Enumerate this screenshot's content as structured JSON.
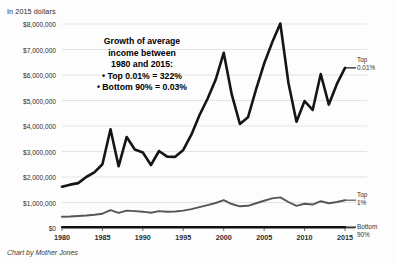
{
  "header": {
    "units_note": "In 2015 dollars"
  },
  "credit": {
    "text": "Chart by Mother Jones"
  },
  "annotation": {
    "line1": "Growth of average",
    "line2": "income between",
    "line3": "1980 and 2015:",
    "line4": "• Top 0.01% = 322%",
    "line5": "• Bottom 90% = 0.03%"
  },
  "legend": {
    "top001_line1": "Top",
    "top001_line2": "0.01%",
    "top1_line1": "Top",
    "top1_line2": "1%",
    "bottom90_line1": "Bottom",
    "bottom90_line2": "90%"
  },
  "axis": {
    "y_ticks": [
      "$0",
      "$1,000,000",
      "$2,000,000",
      "$3,000,000",
      "$4,000,000",
      "$5,000,000",
      "$6,000,000",
      "$7,000,000",
      "$8,000,000"
    ],
    "x_ticks": [
      "1980",
      "1985",
      "1990",
      "1995",
      "2000",
      "2005",
      "2010",
      "2015"
    ]
  },
  "colors": {
    "top001_line": "#151515",
    "top1_line": "#565656",
    "bottom90_line": "#111111",
    "gridline": "#d9d9d9",
    "axis": "#4a4a4a",
    "text": "#1a1a1a"
  },
  "chart_data": {
    "type": "line",
    "title": "",
    "subtitle": "In 2015 dollars",
    "xlabel": "",
    "ylabel": "In 2015 dollars",
    "xlim": [
      1980,
      2015
    ],
    "ylim": [
      0,
      8000000
    ],
    "grid": true,
    "legend_position": "right-inline",
    "ytick_values": [
      0,
      1000000,
      2000000,
      3000000,
      4000000,
      5000000,
      6000000,
      7000000,
      8000000
    ],
    "xtick_values": [
      1980,
      1985,
      1990,
      1995,
      2000,
      2005,
      2010,
      2015
    ],
    "annotations": [
      "Growth of average income between 1980 and 2015:",
      "Top 0.01% = 322%",
      "Bottom 90% = 0.03%"
    ],
    "x": [
      1980,
      1981,
      1982,
      1983,
      1984,
      1985,
      1986,
      1987,
      1988,
      1989,
      1990,
      1991,
      1992,
      1993,
      1994,
      1995,
      1996,
      1997,
      1998,
      1999,
      2000,
      2001,
      2002,
      2003,
      2004,
      2005,
      2006,
      2007,
      2008,
      2009,
      2010,
      2011,
      2012,
      2013,
      2014,
      2015
    ],
    "series": [
      {
        "name": "Top 0.01%",
        "color": "#151515",
        "values": [
          1620000,
          1700000,
          1760000,
          2000000,
          2180000,
          2500000,
          3870000,
          2420000,
          3570000,
          3080000,
          2960000,
          2470000,
          3020000,
          2800000,
          2790000,
          3060000,
          3660000,
          4420000,
          5070000,
          5810000,
          6870000,
          5230000,
          4080000,
          4340000,
          5440000,
          6450000,
          7280000,
          8020000,
          5700000,
          4170000,
          4980000,
          4630000,
          6040000,
          4840000,
          5650000,
          6280000
        ]
      },
      {
        "name": "Top 1%",
        "color": "#565656",
        "values": [
          440000,
          450000,
          470000,
          490000,
          520000,
          560000,
          700000,
          590000,
          680000,
          660000,
          640000,
          600000,
          660000,
          640000,
          650000,
          680000,
          740000,
          820000,
          900000,
          980000,
          1090000,
          940000,
          850000,
          870000,
          970000,
          1070000,
          1160000,
          1200000,
          1020000,
          870000,
          950000,
          920000,
          1050000,
          970000,
          1020000,
          1090000
        ]
      },
      {
        "name": "Bottom 90%",
        "color": "#111111",
        "values": [
          33800,
          33200,
          32700,
          32600,
          33300,
          33600,
          34100,
          34300,
          34500,
          34700,
          34200,
          33400,
          33500,
          33300,
          33500,
          33900,
          34300,
          35000,
          36000,
          36700,
          37100,
          36200,
          35600,
          35300,
          35400,
          35500,
          35800,
          35900,
          34700,
          33400,
          33100,
          32900,
          33300,
          33100,
          33500,
          33900
        ]
      }
    ]
  }
}
